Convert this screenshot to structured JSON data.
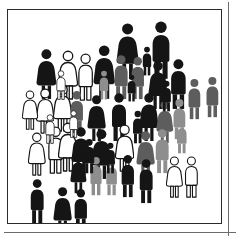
{
  "panel": {
    "name": "crowd-pictogram-illustration",
    "background_color": "#ffffff",
    "frame_color": "#2b2b2b",
    "outer_rule_color": "#6b6b6b",
    "frame": {
      "x": 7,
      "y": 9,
      "width": 215,
      "height": 215
    }
  },
  "palette": {
    "black": "#151515",
    "dark_gray": "#5d5d5d",
    "mid_gray": "#8e8e8e",
    "white": "#ffffff",
    "outline": "#151515"
  },
  "legend": {
    "black_label": "black",
    "dark_gray_label": "dark gray",
    "mid_gray_label": "mid gray",
    "white_label": "white outline"
  },
  "counts": {
    "total": 50,
    "black": 24,
    "dark_gray": 7,
    "mid_gray": 6,
    "white": 13,
    "male": 28,
    "female": 22
  },
  "figures": [
    {
      "id": "p01",
      "x": 108,
      "y": 12,
      "h": 58,
      "tone": "black",
      "sex": "female"
    },
    {
      "id": "p02",
      "x": 141,
      "y": 10,
      "h": 60,
      "tone": "black",
      "sex": "male"
    },
    {
      "id": "p03",
      "x": 28,
      "y": 38,
      "h": 52,
      "tone": "black",
      "sex": "female"
    },
    {
      "id": "p04",
      "x": 50,
      "y": 40,
      "h": 50,
      "tone": "white",
      "sex": "female"
    },
    {
      "id": "p05",
      "x": 68,
      "y": 43,
      "h": 48,
      "tone": "white",
      "sex": "male"
    },
    {
      "id": "p06",
      "x": 85,
      "y": 34,
      "h": 56,
      "tone": "black",
      "sex": "female"
    },
    {
      "id": "p07",
      "x": 104,
      "y": 44,
      "h": 46,
      "tone": "dark_gray",
      "sex": "male"
    },
    {
      "id": "p08",
      "x": 121,
      "y": 46,
      "h": 44,
      "tone": "dark_gray",
      "sex": "male"
    },
    {
      "id": "p09",
      "x": 140,
      "y": 50,
      "h": 50,
      "tone": "black",
      "sex": "female"
    },
    {
      "id": "p10",
      "x": 160,
      "y": 48,
      "h": 52,
      "tone": "black",
      "sex": "male"
    },
    {
      "id": "p11",
      "x": 178,
      "y": 68,
      "h": 42,
      "tone": "dark_gray",
      "sex": "male"
    },
    {
      "id": "p12",
      "x": 196,
      "y": 66,
      "h": 42,
      "tone": "dark_gray",
      "sex": "male"
    },
    {
      "id": "p13",
      "x": 28,
      "y": 78,
      "h": 46,
      "tone": "white",
      "sex": "female"
    },
    {
      "id": "p14",
      "x": 45,
      "y": 74,
      "h": 48,
      "tone": "white",
      "sex": "female"
    },
    {
      "id": "p15",
      "x": 60,
      "y": 80,
      "h": 44,
      "tone": "dark_gray",
      "sex": "male"
    },
    {
      "id": "p16",
      "x": 79,
      "y": 84,
      "h": 48,
      "tone": "black",
      "sex": "female"
    },
    {
      "id": "p17",
      "x": 101,
      "y": 82,
      "h": 50,
      "tone": "black",
      "sex": "male"
    },
    {
      "id": "p18",
      "x": 131,
      "y": 82,
      "h": 50,
      "tone": "black",
      "sex": "female"
    },
    {
      "id": "p19",
      "x": 148,
      "y": 90,
      "h": 44,
      "tone": "dark_gray",
      "sex": "female"
    },
    {
      "id": "p20",
      "x": 163,
      "y": 88,
      "h": 42,
      "tone": "mid_gray",
      "sex": "male"
    },
    {
      "id": "p21",
      "x": 20,
      "y": 122,
      "h": 44,
      "tone": "white",
      "sex": "female"
    },
    {
      "id": "p22",
      "x": 38,
      "y": 116,
      "h": 48,
      "tone": "white",
      "sex": "male"
    },
    {
      "id": "p23",
      "x": 50,
      "y": 112,
      "h": 50,
      "tone": "white",
      "sex": "female"
    },
    {
      "id": "p24",
      "x": 63,
      "y": 116,
      "h": 50,
      "tone": "black",
      "sex": "female"
    },
    {
      "id": "p25",
      "x": 83,
      "y": 118,
      "h": 52,
      "tone": "black",
      "sex": "female"
    },
    {
      "id": "p26",
      "x": 107,
      "y": 114,
      "h": 48,
      "tone": "white",
      "sex": "female"
    },
    {
      "id": "p27",
      "x": 128,
      "y": 120,
      "h": 48,
      "tone": "dark_gray",
      "sex": "female"
    },
    {
      "id": "p28",
      "x": 145,
      "y": 118,
      "h": 46,
      "tone": "mid_gray",
      "sex": "male"
    },
    {
      "id": "p29",
      "x": 62,
      "y": 142,
      "h": 42,
      "tone": "black",
      "sex": "female"
    },
    {
      "id": "p30",
      "x": 80,
      "y": 146,
      "h": 40,
      "tone": "mid_gray",
      "sex": "male"
    },
    {
      "id": "p31",
      "x": 96,
      "y": 148,
      "h": 38,
      "tone": "mid_gray",
      "sex": "male"
    },
    {
      "id": "p32",
      "x": 111,
      "y": 144,
      "h": 44,
      "tone": "black",
      "sex": "male"
    },
    {
      "id": "p33",
      "x": 129,
      "y": 148,
      "h": 46,
      "tone": "black",
      "sex": "male"
    },
    {
      "id": "p34",
      "x": 158,
      "y": 146,
      "h": 42,
      "tone": "white",
      "sex": "female"
    },
    {
      "id": "p35",
      "x": 175,
      "y": 146,
      "h": 42,
      "tone": "white",
      "sex": "male"
    },
    {
      "id": "p36",
      "x": 20,
      "y": 168,
      "h": 46,
      "tone": "black",
      "sex": "male"
    },
    {
      "id": "p37",
      "x": 45,
      "y": 176,
      "h": 48,
      "tone": "black",
      "sex": "female"
    },
    {
      "id": "p38",
      "x": 64,
      "y": 178,
      "h": 44,
      "tone": "black",
      "sex": "male"
    },
    {
      "id": "p39",
      "x": 90,
      "y": 60,
      "h": 30,
      "tone": "mid_gray",
      "sex": "male"
    },
    {
      "id": "p40",
      "x": 118,
      "y": 64,
      "h": 28,
      "tone": "black",
      "sex": "male"
    },
    {
      "id": "p41",
      "x": 133,
      "y": 36,
      "h": 30,
      "tone": "black",
      "sex": "male"
    },
    {
      "id": "p42",
      "x": 14,
      "y": 80,
      "h": 40,
      "tone": "white",
      "sex": "female"
    },
    {
      "id": "p43",
      "x": 36,
      "y": 104,
      "h": 30,
      "tone": "white",
      "sex": "male"
    },
    {
      "id": "p44",
      "x": 152,
      "y": 70,
      "h": 32,
      "tone": "black",
      "sex": "male"
    },
    {
      "id": "p45",
      "x": 167,
      "y": 110,
      "h": 34,
      "tone": "mid_gray",
      "sex": "male"
    },
    {
      "id": "p46",
      "x": 74,
      "y": 128,
      "h": 36,
      "tone": "black",
      "sex": "male"
    },
    {
      "id": "p47",
      "x": 96,
      "y": 132,
      "h": 32,
      "tone": "black",
      "sex": "male"
    },
    {
      "id": "p48",
      "x": 123,
      "y": 100,
      "h": 34,
      "tone": "black",
      "sex": "male"
    },
    {
      "id": "p49",
      "x": 47,
      "y": 60,
      "h": 30,
      "tone": "white",
      "sex": "male"
    },
    {
      "id": "p50",
      "x": 60,
      "y": 100,
      "h": 28,
      "tone": "white",
      "sex": "male"
    }
  ]
}
